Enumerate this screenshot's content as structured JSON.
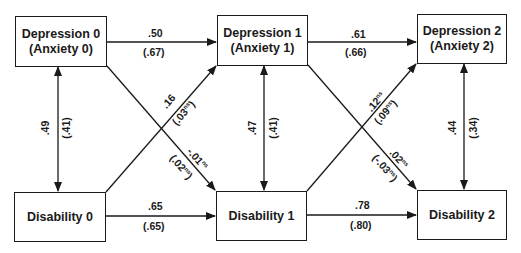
{
  "diagram": {
    "type": "cross-lagged path model",
    "nodes": {
      "dep0": {
        "line1": "Depression 0",
        "line2": "(Anxiety 0)"
      },
      "dep1": {
        "line1": "Depression 1",
        "line2": "(Anxiety 1)"
      },
      "dep2": {
        "line1": "Depression 2",
        "line2": "(Anxiety 2)"
      },
      "dis0": {
        "line1": "Disability 0"
      },
      "dis1": {
        "line1": "Disability 1"
      },
      "dis2": {
        "line1": "Disability 2"
      }
    },
    "edges": {
      "dep0_dep1": {
        "depression": ".50",
        "anxiety": "(.67)"
      },
      "dep1_dep2": {
        "depression": ".61",
        "anxiety": "(.66)"
      },
      "dis0_dis1": {
        "depression": ".65",
        "anxiety": "(.65)"
      },
      "dis1_dis2": {
        "depression": ".78",
        "anxiety": "(.80)"
      },
      "dep0_dis0": {
        "depression": ".49",
        "anxiety": "(.41)"
      },
      "dep1_dis1": {
        "depression": ".47",
        "anxiety": "(.41)"
      },
      "dep2_dis2": {
        "depression": ".44",
        "anxiety": "(.34)"
      },
      "dis0_dep1": {
        "depression": ".16",
        "anxiety": "(.03",
        "anxiety_sup": "ns",
        "anxiety_close": ")"
      },
      "dep0_dis1": {
        "depression": "-.01",
        "depression_sup": "ns",
        "anxiety": "(.02",
        "anxiety_sup": "ns",
        "anxiety_close": ")"
      },
      "dis1_dep2": {
        "depression": ".12",
        "depression_sup": "ns",
        "anxiety": "(.09",
        "anxiety_sup": "ns",
        "anxiety_close": ")"
      },
      "dep1_dis2": {
        "depression": ".02",
        "depression_sup": "ns",
        "anxiety": "(-.03",
        "anxiety_sup": "ns",
        "anxiety_close": ")"
      }
    }
  }
}
